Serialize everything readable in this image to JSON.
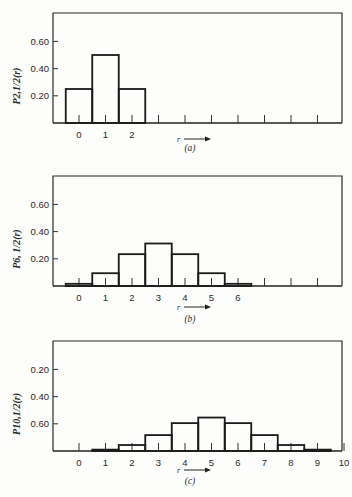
{
  "chart_data": [
    {
      "type": "bar",
      "id": "a",
      "caption": "(a)",
      "ylabel": "P2,1/2(r)",
      "xlabel": "r →",
      "categories": [
        0,
        1,
        2,
        3,
        4,
        5,
        6,
        7,
        8,
        9
      ],
      "x_tick_labels": [
        "0",
        "1",
        "2"
      ],
      "bars": [
        {
          "r": 0,
          "value": 0.25
        },
        {
          "r": 1,
          "value": 0.5
        },
        {
          "r": 2,
          "value": 0.25
        }
      ],
      "y_ticks": [
        {
          "label": "0.20",
          "value": 0.2
        },
        {
          "label": "0.40",
          "value": 0.4
        },
        {
          "label": "0.60",
          "value": 0.6
        }
      ],
      "ylim": [
        0,
        0.8
      ]
    },
    {
      "type": "bar",
      "id": "b",
      "caption": "(b)",
      "ylabel": "P6, 1/2(r)",
      "xlabel": "r →",
      "categories": [
        0,
        1,
        2,
        3,
        4,
        5,
        6,
        7,
        8,
        9
      ],
      "x_tick_labels": [
        "0",
        "1",
        "2",
        "3",
        "4",
        "5",
        "6"
      ],
      "bars": [
        {
          "r": 0,
          "value": 0.016
        },
        {
          "r": 1,
          "value": 0.094
        },
        {
          "r": 2,
          "value": 0.234
        },
        {
          "r": 3,
          "value": 0.3125
        },
        {
          "r": 4,
          "value": 0.234
        },
        {
          "r": 5,
          "value": 0.094
        },
        {
          "r": 6,
          "value": 0.016
        }
      ],
      "y_ticks": [
        {
          "label": "0.20",
          "value": 0.2
        },
        {
          "label": "0.40",
          "value": 0.4
        },
        {
          "label": "0.60",
          "value": 0.6
        }
      ],
      "ylim": [
        0,
        0.8
      ]
    },
    {
      "type": "bar",
      "id": "c",
      "caption": "(c)",
      "ylabel": "P10,1/2(r)",
      "xlabel": "r →",
      "categories": [
        0,
        1,
        2,
        3,
        4,
        5,
        6,
        7,
        8,
        9,
        10
      ],
      "x_tick_labels": [
        "0",
        "1",
        "2",
        "3",
        "4",
        "5",
        "6",
        "7",
        "8",
        "9",
        "10"
      ],
      "bars": [
        {
          "r": 0,
          "value": 0.001
        },
        {
          "r": 1,
          "value": 0.01
        },
        {
          "r": 2,
          "value": 0.044
        },
        {
          "r": 3,
          "value": 0.117
        },
        {
          "r": 4,
          "value": 0.205
        },
        {
          "r": 5,
          "value": 0.246
        },
        {
          "r": 6,
          "value": 0.205
        },
        {
          "r": 7,
          "value": 0.117
        },
        {
          "r": 8,
          "value": 0.044
        },
        {
          "r": 9,
          "value": 0.01
        },
        {
          "r": 10,
          "value": 0.001
        }
      ],
      "y_ticks": [
        {
          "label": "0.20",
          "value": 0.6
        },
        {
          "label": "0.40",
          "value": 0.4
        },
        {
          "label": "0.60",
          "value": 0.2
        }
      ],
      "ylim": [
        0,
        0.8
      ]
    }
  ]
}
